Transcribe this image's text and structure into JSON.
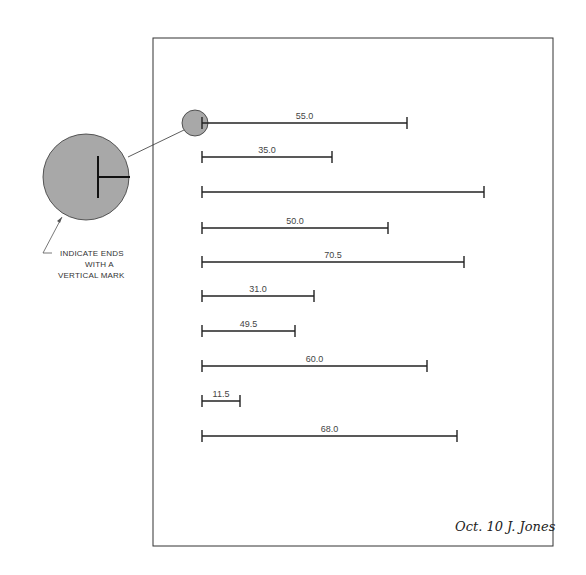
{
  "callout": {
    "lines": [
      "INDICATE ENDS",
      "WITH A",
      "VERTICAL MARK"
    ]
  },
  "signature": "Oct. 10 J. Jones",
  "colors": {
    "line": "#222222",
    "circle_fill": "#a8a8a8",
    "page_border": "#333333"
  },
  "lines": [
    {
      "label": "55.0",
      "x_end": 407,
      "y": 123
    },
    {
      "label": "35.0",
      "x_end": 332,
      "y": 157
    },
    {
      "label": "",
      "x_end": 484,
      "y": 192
    },
    {
      "label": "50.0",
      "x_end": 388,
      "y": 228
    },
    {
      "label": "70.5",
      "x_end": 464,
      "y": 262
    },
    {
      "label": "31.0",
      "x_end": 314,
      "y": 296
    },
    {
      "label": "49.5",
      "x_end": 295,
      "y": 331
    },
    {
      "label": "60.0",
      "x_end": 427,
      "y": 366
    },
    {
      "label": "11.5",
      "x_end": 240,
      "y": 401
    },
    {
      "label": "68.0",
      "x_end": 457,
      "y": 436
    }
  ]
}
